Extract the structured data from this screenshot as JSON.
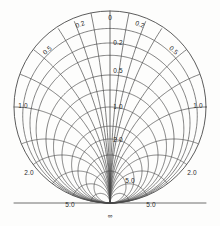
{
  "chart_data": {
    "type": "line",
    "title": "",
    "subtitle": "",
    "xlabel": "",
    "ylabel": "",
    "chart_kind": "smith-chart-half",
    "grid": true,
    "legend_position": "none",
    "background_color": "#fdfdfc",
    "line_color": "#4a4a4a",
    "text_color": "#2b2b2b",
    "geometry": {
      "center_x": 110,
      "center_y": 107,
      "radius": 96,
      "convergence_x": 110,
      "convergence_y": 203
    },
    "resistance_circles": [
      0.2,
      0.5,
      1.0,
      2.0,
      5.0
    ],
    "reactance_arcs": [
      0.2,
      0.5,
      1.0,
      2.0,
      5.0
    ],
    "axis_values": [
      "0",
      "0.2",
      "0.5",
      "1.0",
      "2.0",
      "5.0"
    ],
    "labels": [
      {
        "text": "0",
        "x": 110,
        "y": 17,
        "rot": 0,
        "name": "label-top-0"
      },
      {
        "text": "0.2",
        "x": 80,
        "y": 24,
        "rot": -20,
        "name": "label-left-0-2"
      },
      {
        "text": "0.2",
        "x": 140,
        "y": 24,
        "rot": 20,
        "name": "label-right-0-2"
      },
      {
        "text": "0.5",
        "x": 47,
        "y": 50,
        "rot": -42,
        "name": "label-left-0-5"
      },
      {
        "text": "0.5",
        "x": 174,
        "y": 50,
        "rot": 42,
        "name": "label-right-0-5"
      },
      {
        "text": "1.0",
        "x": 23,
        "y": 105,
        "rot": 0,
        "name": "label-left-1-0"
      },
      {
        "text": "1.0",
        "x": 198,
        "y": 105,
        "rot": 0,
        "name": "label-right-1-0"
      },
      {
        "text": "2.0",
        "x": 29,
        "y": 172,
        "rot": 0,
        "name": "label-left-2-0"
      },
      {
        "text": "2.0",
        "x": 192,
        "y": 172,
        "rot": 0,
        "name": "label-right-2-0"
      },
      {
        "text": "5.0",
        "x": 70,
        "y": 204,
        "rot": 0,
        "name": "label-bottom-left-5-0"
      },
      {
        "text": "5.0",
        "x": 151,
        "y": 204,
        "rot": 0,
        "name": "label-bottom-right-5-0"
      },
      {
        "text": "0.2",
        "x": 118,
        "y": 42,
        "rot": 0,
        "name": "label-axis-0-2"
      },
      {
        "text": "0.5",
        "x": 118,
        "y": 70,
        "rot": 0,
        "name": "label-axis-0-5"
      },
      {
        "text": "1.0",
        "x": 118,
        "y": 106,
        "rot": 0,
        "name": "label-axis-1-0"
      },
      {
        "text": "2.0",
        "x": 118,
        "y": 139,
        "rot": 0,
        "name": "label-axis-2-0"
      },
      {
        "text": "5.0",
        "x": 130,
        "y": 180,
        "rot": 0,
        "name": "label-axis-5-0"
      },
      {
        "text": "∞",
        "x": 110,
        "y": 215,
        "rot": 0,
        "name": "label-center-infinity"
      }
    ]
  }
}
